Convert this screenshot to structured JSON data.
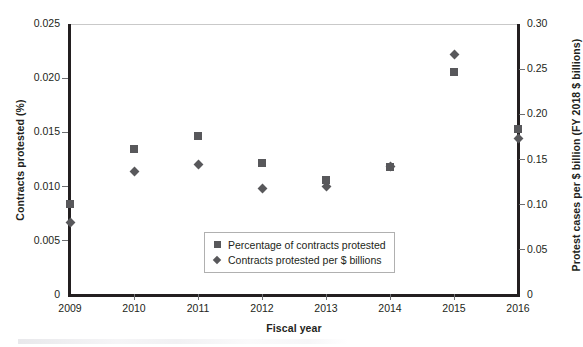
{
  "chart_data": {
    "type": "scatter",
    "title": "",
    "xlabel": "Fiscal year",
    "ylabel": "Contracts protested (%)",
    "ylabel_right": "Protest cases per $ billion (FY 2018 $ billions)",
    "grid": false,
    "legend_position": "inside-bottom-center",
    "categories": [
      2009,
      2010,
      2011,
      2012,
      2013,
      2014,
      2015,
      2016
    ],
    "x_tick_labels": [
      "2009",
      "2010",
      "2011",
      "2012",
      "2013",
      "2014",
      "2015",
      "2016"
    ],
    "xlim": [
      2009,
      2016
    ],
    "ylim": [
      0,
      0.025
    ],
    "y_tick_labels": [
      "0",
      "0.005",
      "0.010",
      "0.015",
      "0.020",
      "0.025"
    ],
    "y_ticks": [
      0,
      0.005,
      0.01,
      0.015,
      0.02,
      0.025
    ],
    "ylim_right": [
      0,
      0.3
    ],
    "y_tick_labels_right": [
      "0",
      "0.05",
      "0.10",
      "0.15",
      "0.20",
      "0.25",
      "0.30"
    ],
    "y_ticks_right": [
      0,
      0.05,
      0.1,
      0.15,
      0.2,
      0.25,
      0.3
    ],
    "series": [
      {
        "name": "Percentage of contracts protested",
        "marker": "square",
        "color": "#58585b",
        "axis": "left",
        "values": [
          0.0084,
          0.0135,
          0.0147,
          0.0122,
          0.0106,
          0.0118,
          0.0206,
          0.0153
        ]
      },
      {
        "name": "Contracts protested per $ billions",
        "marker": "diamond",
        "color": "#58585b",
        "axis": "right",
        "values": [
          0.08,
          0.137,
          0.144,
          0.118,
          0.12,
          0.142,
          0.266,
          0.173
        ],
        "values_in_left_axis_units": [
          0.0067,
          0.0114,
          0.012,
          0.0098,
          0.01,
          0.0118,
          0.0222,
          0.0144
        ]
      }
    ]
  },
  "legend": {
    "items": [
      {
        "label": "Percentage of contracts protested",
        "marker": "square"
      },
      {
        "label": "Contracts protested per $ billions",
        "marker": "diamond"
      }
    ]
  },
  "colors": {
    "marker": "#58585b",
    "axis": "#231f20",
    "tick": "#6d6e71",
    "frame_top": "#c9c9c9",
    "legend_border": "#b0b0b0",
    "background": "#ffffff"
  }
}
